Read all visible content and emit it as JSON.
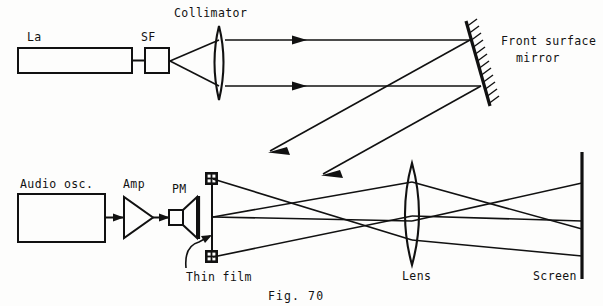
{
  "figure": {
    "caption": "Fig. 70",
    "type": "optical-setup-schematic"
  },
  "labels": {
    "laser": "La",
    "spatial_filter": "SF",
    "collimator": "Collimator",
    "mirror_line1": "Front surface",
    "mirror_line2": "mirror",
    "audio_oscillator": "Audio osc.",
    "amplifier": "Amp",
    "transducer": "PM",
    "thin_film": "Thin film",
    "lens": "Lens",
    "screen": "Screen"
  },
  "colors": {
    "ink": "#111111",
    "paper": "#fdfdfc"
  },
  "components": [
    {
      "name": "laser",
      "label": "La",
      "shape": "rectangle"
    },
    {
      "name": "spatial-filter",
      "label": "SF",
      "shape": "small-square"
    },
    {
      "name": "collimator",
      "label": "Collimator",
      "shape": "biconvex-lens"
    },
    {
      "name": "front-surface-mirror",
      "label": "Front surface mirror",
      "shape": "hatched-tilted-line"
    },
    {
      "name": "audio-oscillator",
      "label": "Audio osc.",
      "shape": "rectangle"
    },
    {
      "name": "amplifier",
      "label": "Amp",
      "shape": "triangle"
    },
    {
      "name": "transducer",
      "label": "PM",
      "shape": "horn"
    },
    {
      "name": "thin-film",
      "label": "Thin film",
      "shape": "clamped-vertical-line"
    },
    {
      "name": "lens",
      "label": "Lens",
      "shape": "biconvex-lens"
    },
    {
      "name": "screen",
      "label": "Screen",
      "shape": "vertical-line"
    }
  ]
}
